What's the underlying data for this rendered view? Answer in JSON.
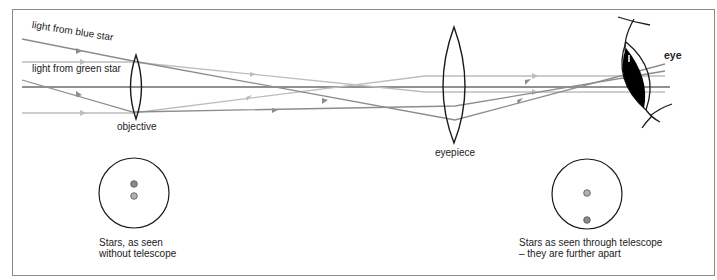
{
  "diagram": {
    "type": "refracting telescope ray diagram",
    "colors": {
      "frame": "#8a8a8a",
      "lens": "#1a1a1a",
      "axis": "#222222",
      "blue_star_rays": "#8c8c8c",
      "green_star_rays": "#bdbdbd",
      "star_blue": "#8a8a8a",
      "star_green": "#a8a8a8",
      "pupil": "#000000"
    },
    "labels": {
      "blue_star_light": "light from blue star",
      "green_star_light": "light from green star",
      "objective": "objective",
      "eyepiece": "eyepiece",
      "eye": "eye"
    },
    "views": [
      {
        "id": "without-telescope",
        "caption_line1": "Stars, as seen",
        "caption_line2": "without telescope",
        "star_separation": "close"
      },
      {
        "id": "through-telescope",
        "caption_line1": "Stars as seen through telescope",
        "caption_line2": "– they are further apart",
        "star_separation": "far"
      }
    ]
  }
}
